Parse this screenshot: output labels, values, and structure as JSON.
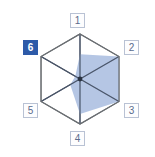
{
  "widget": {
    "name": "hexagon-radar-selector",
    "type": "radar",
    "selected_axis": "6"
  },
  "labels": [
    {
      "id": "1",
      "text": "1",
      "position": "top",
      "selected": false
    },
    {
      "id": "2",
      "text": "2",
      "position": "upper-right",
      "selected": false
    },
    {
      "id": "3",
      "text": "3",
      "position": "lower-right",
      "selected": false
    },
    {
      "id": "4",
      "text": "4",
      "position": "bottom",
      "selected": false
    },
    {
      "id": "5",
      "text": "5",
      "position": "lower-left",
      "selected": false
    },
    {
      "id": "6",
      "text": "6",
      "position": "upper-left",
      "selected": true
    }
  ],
  "colors": {
    "fill": "#a8bcdf",
    "fill_opacity": "0.85",
    "grid_line": "#6b6f73",
    "spoke_line": "#4a5568",
    "center_dot": "#2a3342",
    "label_border": "#b9c2d4",
    "label_text": "#5a6b8c",
    "label_background": "#fdfdfe",
    "selected_background": "#2d5aa8",
    "selected_text": "#ffffff",
    "page_background": "#ffffff"
  },
  "chart_data": {
    "type": "radar",
    "title": "",
    "xlabel": "",
    "ylabel": "",
    "categories": [
      "1",
      "2",
      "3",
      "4",
      "5",
      "6"
    ],
    "values": [
      0.55,
      1.0,
      1.0,
      0.78,
      0.25,
      0.12
    ],
    "rlim": [
      0,
      1
    ],
    "grid": true,
    "legend": "none",
    "axis_count": 6,
    "outline_shape": "hexagon",
    "series": [
      {
        "name": "values",
        "values": [
          0.55,
          1.0,
          1.0,
          0.78,
          0.25,
          0.12
        ]
      }
    ],
    "annotations": [
      "Axis 6 label is highlighted/selected"
    ]
  },
  "geometry": {
    "center_x": 80,
    "center_y": 79,
    "radius": 45
  }
}
